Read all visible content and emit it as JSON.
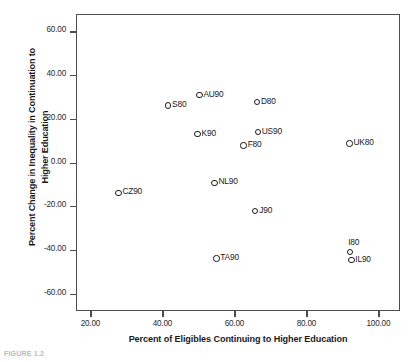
{
  "chart_data": {
    "type": "scatter",
    "title": "",
    "xlabel": "Percent of Eligibles Continuing to Higher Education",
    "ylabel": "Percent Change in Inequality in Continuation to Higher Education",
    "ylabel_line1": "Percent Change in Inequality in Continuation to",
    "ylabel_line2": "Higher Education",
    "xlim": [
      16.0,
      106.0
    ],
    "ylim": [
      -68.0,
      68.0
    ],
    "grid": false,
    "legend": "none",
    "xticks": [
      "20.00",
      "40.00",
      "60.00",
      "80.00",
      "100.00"
    ],
    "xtick_values": [
      20,
      40,
      60,
      80,
      100
    ],
    "yticks": [
      "60.00",
      "40.00",
      "20.00",
      "0.00",
      "-20.00",
      "-40.00",
      "-60.00"
    ],
    "ytick_values": [
      60,
      40,
      20,
      0,
      -20,
      -40,
      -60
    ],
    "points": [
      {
        "label": "AU90",
        "x": 50.0,
        "y": 31.3,
        "label_pos": "right"
      },
      {
        "label": "D80",
        "x": 66.0,
        "y": 28.2,
        "label_pos": "right"
      },
      {
        "label": "S80",
        "x": 41.3,
        "y": 26.5,
        "label_pos": "right"
      },
      {
        "label": "US90",
        "x": 66.2,
        "y": 14.3,
        "label_pos": "right"
      },
      {
        "label": "K90",
        "x": 49.5,
        "y": 13.5,
        "label_pos": "right"
      },
      {
        "label": "UK80",
        "x": 91.7,
        "y": 9.1,
        "label_pos": "right"
      },
      {
        "label": "F80",
        "x": 62.3,
        "y": 8.2,
        "label_pos": "right"
      },
      {
        "label": "NL90",
        "x": 54.2,
        "y": -8.8,
        "label_pos": "right"
      },
      {
        "label": "CZ90",
        "x": 27.5,
        "y": -13.4,
        "label_pos": "right"
      },
      {
        "label": "J90",
        "x": 65.5,
        "y": -21.8,
        "label_pos": "right"
      },
      {
        "label": "I80",
        "x": 91.9,
        "y": -40.5,
        "label_pos": "above"
      },
      {
        "label": "TA90",
        "x": 54.7,
        "y": -43.5,
        "label_pos": "right"
      },
      {
        "label": "IL90",
        "x": 92.2,
        "y": -44.1,
        "label_pos": "right"
      }
    ]
  },
  "caption": "FIGURE 1.2",
  "colors": {
    "frame": "#4d4d4d",
    "marker": "#1a1a1a",
    "text": "#1a1a1a",
    "tick_text": "#2b2b2b",
    "background": "#ffffff"
  }
}
